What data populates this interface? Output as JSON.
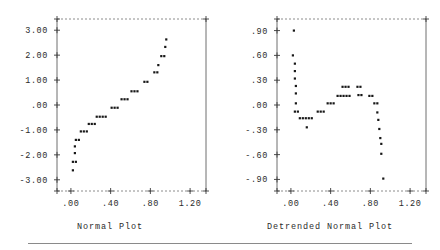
{
  "figure": {
    "background": "#ffffff",
    "point_color": "#171717",
    "axis_color": "#4a4a4a"
  },
  "panels": [
    {
      "id": "normal-plot",
      "caption": "Normal Plot",
      "chart_data": {
        "type": "scatter",
        "title": "Normal Plot",
        "xlabel": "",
        "ylabel": "",
        "xlim": [
          -0.14,
          1.36
        ],
        "ylim": [
          -3.45,
          3.45
        ],
        "xticks": [
          0.0,
          0.4,
          0.8,
          1.2
        ],
        "xtick_labels": [
          ".00",
          ".40",
          ".80",
          "1.20"
        ],
        "yticks": [
          3.0,
          2.0,
          1.0,
          0.0,
          -1.0,
          -2.0,
          -3.0
        ],
        "ytick_labels": [
          "3.00",
          "2.00",
          "1.00",
          ".00",
          "-1.00",
          "-2.00",
          "-3.00"
        ],
        "grid": false,
        "legend": "none",
        "points": [
          [
            0.02,
            -2.62
          ],
          [
            0.02,
            -2.28
          ],
          [
            0.05,
            -2.28
          ],
          [
            0.04,
            -1.93
          ],
          [
            0.04,
            -1.66
          ],
          [
            0.05,
            -1.4
          ],
          [
            0.08,
            -1.4
          ],
          [
            0.1,
            -1.06
          ],
          [
            0.13,
            -1.06
          ],
          [
            0.16,
            -1.06
          ],
          [
            0.18,
            -0.76
          ],
          [
            0.21,
            -0.76
          ],
          [
            0.24,
            -0.76
          ],
          [
            0.26,
            -0.47
          ],
          [
            0.29,
            -0.47
          ],
          [
            0.32,
            -0.47
          ],
          [
            0.35,
            -0.47
          ],
          [
            0.41,
            -0.11
          ],
          [
            0.44,
            -0.11
          ],
          [
            0.47,
            -0.11
          ],
          [
            0.51,
            0.23
          ],
          [
            0.54,
            0.23
          ],
          [
            0.57,
            0.23
          ],
          [
            0.61,
            0.55
          ],
          [
            0.64,
            0.55
          ],
          [
            0.67,
            0.55
          ],
          [
            0.74,
            0.93
          ],
          [
            0.77,
            0.93
          ],
          [
            0.84,
            1.31
          ],
          [
            0.87,
            1.31
          ],
          [
            0.88,
            1.6
          ],
          [
            0.91,
            1.96
          ],
          [
            0.94,
            1.96
          ],
          [
            0.95,
            2.33
          ],
          [
            0.96,
            2.63
          ]
        ]
      }
    },
    {
      "id": "detrended-normal-plot",
      "caption": "Detrended Normal Plot",
      "chart_data": {
        "type": "scatter",
        "title": "Detrended Normal Plot",
        "xlabel": "",
        "ylabel": "",
        "xlim": [
          -0.14,
          1.36
        ],
        "ylim": [
          -1.04,
          1.04
        ],
        "xticks": [
          0.0,
          0.4,
          0.8,
          1.2
        ],
        "xtick_labels": [
          ".00",
          ".40",
          ".80",
          "1.20"
        ],
        "yticks": [
          0.9,
          0.6,
          0.3,
          0.0,
          -0.3,
          -0.6,
          -0.9
        ],
        "ytick_labels": [
          ".90",
          ".60",
          ".30",
          ".00",
          "-.30",
          "-.60",
          "-.90"
        ],
        "grid": false,
        "legend": "none",
        "points": [
          [
            0.03,
            0.9
          ],
          [
            0.02,
            0.6
          ],
          [
            0.04,
            0.5
          ],
          [
            0.04,
            0.41
          ],
          [
            0.04,
            0.32
          ],
          [
            0.05,
            0.23
          ],
          [
            0.05,
            0.14
          ],
          [
            0.05,
            0.02
          ],
          [
            0.04,
            -0.08
          ],
          [
            0.07,
            -0.08
          ],
          [
            0.09,
            -0.16
          ],
          [
            0.12,
            -0.16
          ],
          [
            0.15,
            -0.16
          ],
          [
            0.18,
            -0.16
          ],
          [
            0.21,
            -0.16
          ],
          [
            0.16,
            -0.27
          ],
          [
            0.27,
            -0.08
          ],
          [
            0.3,
            -0.08
          ],
          [
            0.33,
            -0.08
          ],
          [
            0.37,
            0.02
          ],
          [
            0.4,
            0.02
          ],
          [
            0.43,
            0.02
          ],
          [
            0.47,
            0.11
          ],
          [
            0.5,
            0.11
          ],
          [
            0.53,
            0.11
          ],
          [
            0.56,
            0.11
          ],
          [
            0.59,
            0.11
          ],
          [
            0.52,
            0.22
          ],
          [
            0.55,
            0.22
          ],
          [
            0.58,
            0.22
          ],
          [
            0.67,
            0.22
          ],
          [
            0.7,
            0.22
          ],
          [
            0.68,
            0.12
          ],
          [
            0.71,
            0.12
          ],
          [
            0.79,
            0.11
          ],
          [
            0.82,
            0.11
          ],
          [
            0.84,
            0.02
          ],
          [
            0.87,
            0.02
          ],
          [
            0.87,
            -0.09
          ],
          [
            0.88,
            -0.18
          ],
          [
            0.89,
            -0.29
          ],
          [
            0.9,
            -0.4
          ],
          [
            0.91,
            -0.47
          ],
          [
            0.91,
            -0.59
          ],
          [
            0.93,
            -0.89
          ]
        ]
      }
    }
  ]
}
